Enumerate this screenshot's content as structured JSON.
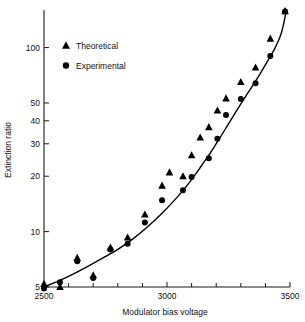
{
  "chart_data": {
    "type": "scatter",
    "title": "",
    "xlabel": "Modulator bias voltage",
    "ylabel": "Extinction ratio",
    "xlim": [
      2500,
      3500
    ],
    "ylim": [
      5,
      160
    ],
    "yscale": "log",
    "xscale": "linear",
    "grid": false,
    "legend_position": "upper-left",
    "xticks": [
      2500,
      2600,
      2700,
      2800,
      2900,
      3000,
      3100,
      3200,
      3300,
      3400,
      3500
    ],
    "xticklabels": [
      "2500",
      "",
      "",
      "",
      "",
      "3000",
      "",
      "",
      "",
      "",
      "3500"
    ],
    "yticks": [
      5,
      10,
      20,
      30,
      40,
      50,
      100
    ],
    "yticklabels": [
      "5",
      "10",
      "20",
      "30",
      "40",
      "50",
      "100"
    ],
    "series": [
      {
        "name": "Theoretical",
        "marker": "triangle",
        "color": "#000000",
        "x": [
          2500,
          2565,
          2635,
          2700,
          2770,
          2840,
          2910,
          2980,
          3010,
          3065,
          3100,
          3135,
          3170,
          3205,
          3240,
          3300,
          3360,
          3420,
          3480
        ],
        "y": [
          5.2,
          5.0,
          7.2,
          5.8,
          8.2,
          9.3,
          12.4,
          17.8,
          21.0,
          20.0,
          26.0,
          32.5,
          37.0,
          45.5,
          53.0,
          65.0,
          78.0,
          112.0,
          158.0
        ]
      },
      {
        "name": "Experimental",
        "marker": "circle",
        "color": "#000000",
        "x": [
          2500,
          2565,
          2635,
          2700,
          2770,
          2840,
          2910,
          2980,
          3065,
          3100,
          3170,
          3205,
          3240,
          3300,
          3360,
          3420,
          3480
        ],
        "y": [
          4.9,
          5.3,
          6.9,
          5.6,
          8.0,
          8.6,
          11.2,
          14.8,
          16.8,
          19.8,
          25.0,
          32.0,
          43.0,
          52.5,
          64.0,
          90.0,
          157.0
        ]
      }
    ],
    "fit_curve": {
      "name": "fitted-curve",
      "x": [
        2500,
        2560,
        2620,
        2680,
        2740,
        2800,
        2860,
        2920,
        2980,
        3040,
        3090,
        3130,
        3170,
        3210,
        3250,
        3290,
        3330,
        3370,
        3410,
        3440,
        3465,
        3485
      ],
      "y": [
        5.0,
        5.4,
        5.9,
        6.5,
        7.2,
        8.0,
        9.1,
        10.6,
        12.6,
        15.3,
        18.4,
        21.8,
        26.0,
        31.5,
        38.5,
        47.0,
        57.0,
        69.0,
        85.0,
        100.0,
        120.0,
        158.0
      ]
    },
    "legend_entries": [
      {
        "label": "Theoretical",
        "marker": "triangle"
      },
      {
        "label": "Experimental",
        "marker": "circle"
      }
    ]
  }
}
